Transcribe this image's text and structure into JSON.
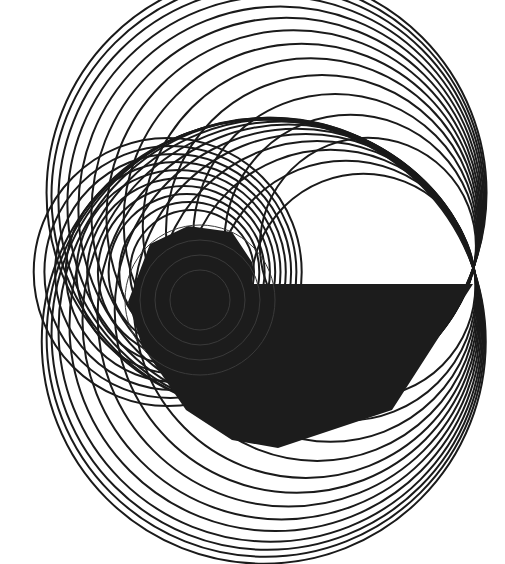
{
  "canvas": {
    "width": 505,
    "height": 564,
    "background": "#ffffff"
  },
  "colors": {
    "stroke": "#1a1a1a",
    "fill": "#1c1c1c",
    "fill_inner": "#262626"
  },
  "upper_circles": {
    "tangent_point": [
      474,
      266
    ],
    "radii": [
      108,
      126,
      142,
      156,
      168,
      178,
      187,
      195,
      202,
      208,
      213,
      217,
      220
    ],
    "stroke_width": 2
  },
  "lower_circles": {
    "tangent_point": [
      474,
      266
    ],
    "radii": [
      112,
      130,
      146,
      160,
      172,
      182,
      191,
      199,
      206,
      212,
      216,
      219,
      222
    ],
    "center_dy": 0.32,
    "stroke_width": 2
  },
  "left_circles": {
    "center": [
      192,
      272
    ],
    "dx_step": -9,
    "radii": [
      62,
      70,
      78,
      86,
      94,
      102,
      110,
      118,
      126,
      134
    ],
    "stroke_width": 2
  },
  "polygon": {
    "points": [
      [
        188,
        226
      ],
      [
        232,
        232
      ],
      [
        252,
        262
      ],
      [
        252,
        284
      ],
      [
        473,
        284
      ],
      [
        392,
        410
      ],
      [
        278,
        448
      ],
      [
        232,
        440
      ],
      [
        186,
        410
      ],
      [
        142,
        346
      ],
      [
        128,
        302
      ],
      [
        150,
        244
      ]
    ]
  }
}
